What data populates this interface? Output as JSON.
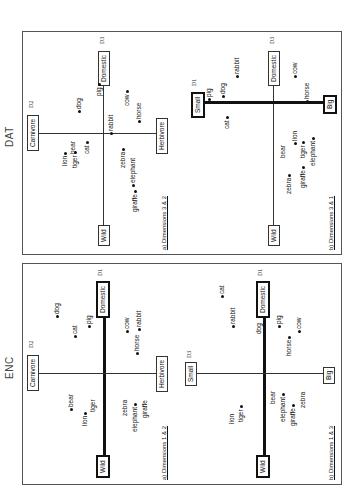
{
  "groups": [
    {
      "label": "ENC",
      "plots": [
        {
          "subtitle": "a) Dimensions 1 & 2",
          "x_axis": {
            "neg": "Wild",
            "pos": "Domestic",
            "dim": "D1",
            "bold": true
          },
          "y_axis": {
            "neg": "Herbivore",
            "pos": "Carnivore",
            "dim": "D2",
            "bold": false
          },
          "points": [
            "dog",
            "cat",
            "pig",
            "cow",
            "horse",
            "rabbit",
            "bear",
            "lion",
            "tiger",
            "zebra",
            "elephant",
            "giraffe"
          ]
        },
        {
          "subtitle": "b) Dimensions 1 & 3",
          "x_axis": {
            "neg": "Wild",
            "pos": "Domestic",
            "dim": "D1",
            "bold": true
          },
          "y_axis": {
            "neg": "Big",
            "pos": "Small",
            "dim": "D3",
            "bold": false
          },
          "points": [
            "cat",
            "rabbit",
            "dog",
            "pig",
            "horse",
            "cow",
            "bear",
            "lion",
            "tiger",
            "elephant",
            "giraffe",
            "zebra"
          ]
        }
      ]
    },
    {
      "label": "DAT",
      "plots": [
        {
          "subtitle": "a) Dimensions 3 & 2",
          "x_axis": {
            "neg": "Wild",
            "pos": "Domestic",
            "dim": "D3",
            "bold": false
          },
          "y_axis": {
            "neg": "Herbivore",
            "pos": "Carnivore",
            "dim": "D2",
            "bold": false
          },
          "points": [
            "dog",
            "pig",
            "cow",
            "rabbit",
            "horse",
            "cat",
            "lion",
            "bear",
            "tiger",
            "zebra",
            "elephant",
            "giraffe"
          ]
        },
        {
          "subtitle": "b) Dimensions 3 & 1",
          "x_axis": {
            "neg": "Wild",
            "pos": "Domestic",
            "dim": "D3",
            "bold": false
          },
          "y_axis": {
            "neg": "Big",
            "pos": "Small",
            "dim": "D1",
            "bold": true
          },
          "points": [
            "rabbit",
            "dog",
            "pig",
            "cat",
            "cow",
            "horse",
            "bear",
            "lion",
            "tiger",
            "elephant",
            "zebra",
            "giraffe"
          ]
        }
      ]
    }
  ]
}
